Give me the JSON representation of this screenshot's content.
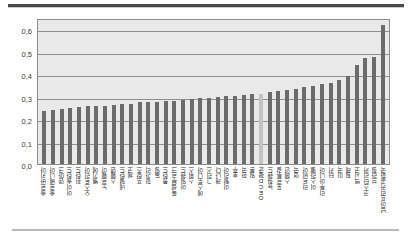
{
  "chart_data": {
    "type": "bar",
    "title": "",
    "subtitle": "",
    "xlabel": "",
    "ylabel": "",
    "ylim": [
      0.0,
      0.65
    ],
    "ytick_labels": [
      "0,0",
      "0,1",
      "0,2",
      "0,3",
      "0,4",
      "0,5",
      "0,6"
    ],
    "ytick_values": [
      0.0,
      0.1,
      0.2,
      0.3,
      0.4,
      0.5,
      0.6
    ],
    "grid": true,
    "gridlines_horizontal": true,
    "legend": null,
    "legend_position": "none",
    "bar_color": "#6b6b6b",
    "highlight_color": "#c3c3c3",
    "highlight_index": 25,
    "plot_background": "#e9e9e9",
    "categories": [
      "슬로바키아",
      "슬로베니아",
      "덴마크",
      "아이슬란드",
      "핀란드",
      "오스트리아",
      "벨기에",
      "노르웨이",
      "스웨덴",
      "네덜란드",
      "체코",
      "프랑스",
      "헝가리",
      "독일",
      "폴란드",
      "룩셈부르크",
      "아일랜드",
      "스위스",
      "에스토니아",
      "그리스",
      "캐나다",
      "이탈리아",
      "호주",
      "한국",
      "일본",
      "OECD평균",
      "뉴질랜드",
      "포르투갈",
      "스페인",
      "영국",
      "라트비아",
      "이스라엘",
      "리투아니아",
      "터키",
      "미국",
      "칠레",
      "멕시코",
      "코스타리카",
      "브라질",
      "남아프리카공화국"
    ],
    "values": [
      0.236,
      0.24,
      0.244,
      0.249,
      0.255,
      0.257,
      0.258,
      0.259,
      0.262,
      0.266,
      0.268,
      0.274,
      0.277,
      0.278,
      0.281,
      0.282,
      0.285,
      0.289,
      0.293,
      0.295,
      0.298,
      0.302,
      0.304,
      0.306,
      0.31,
      0.313,
      0.32,
      0.325,
      0.33,
      0.335,
      0.341,
      0.348,
      0.355,
      0.362,
      0.375,
      0.394,
      0.44,
      0.47,
      0.478,
      0.62
    ]
  }
}
